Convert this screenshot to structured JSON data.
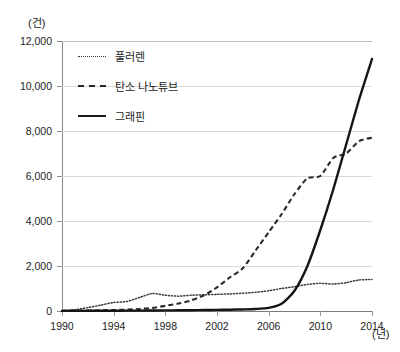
{
  "chart_data": {
    "type": "line",
    "title": "",
    "subtitle": "",
    "xlabel": "(년)",
    "ylabel": "(건)",
    "x": [
      1990,
      1991,
      1992,
      1993,
      1994,
      1995,
      1996,
      1997,
      1998,
      1999,
      2000,
      2001,
      2002,
      2003,
      2004,
      2005,
      2006,
      2007,
      2008,
      2009,
      2010,
      2011,
      2012,
      2013,
      2014
    ],
    "xlim": [
      1990,
      2014
    ],
    "ylim": [
      0,
      12000
    ],
    "ytick_values": [
      0,
      2000,
      4000,
      6000,
      8000,
      10000,
      12000
    ],
    "ytick_labels": [
      "0",
      "2,000",
      "4,000",
      "6,000",
      "8,000",
      "10,000",
      "12,000"
    ],
    "xtick_values": [
      1990,
      1994,
      1998,
      2002,
      2006,
      2010,
      2014
    ],
    "xtick_labels": [
      "1990",
      "1994",
      "1998",
      "2002",
      "2006",
      "2010",
      "2014"
    ],
    "grid": true,
    "legend_position": "upper-left",
    "series": [
      {
        "name": "풀러렌",
        "style": "dotted",
        "color": "#3a3a3a",
        "values": [
          20,
          60,
          150,
          260,
          380,
          420,
          600,
          780,
          700,
          660,
          700,
          720,
          740,
          760,
          790,
          830,
          900,
          1000,
          1080,
          1180,
          1230,
          1200,
          1260,
          1380,
          1400
        ]
      },
      {
        "name": "탄소 나노튜브",
        "style": "dashed",
        "color": "#2a2a2a",
        "values": [
          10,
          15,
          20,
          30,
          45,
          60,
          90,
          140,
          230,
          330,
          470,
          700,
          1050,
          1500,
          1900,
          2700,
          3500,
          4300,
          5200,
          5900,
          6000,
          6800,
          7000,
          7550,
          7700
        ]
      },
      {
        "name": "그래핀",
        "style": "solid",
        "color": "#151515",
        "values": [
          5,
          6,
          8,
          10,
          12,
          15,
          18,
          22,
          26,
          30,
          36,
          42,
          50,
          58,
          70,
          90,
          140,
          320,
          900,
          2000,
          3600,
          5400,
          7400,
          9400,
          11200
        ]
      }
    ]
  },
  "axes": {
    "y_unit": "(건)",
    "x_unit": "(년)"
  },
  "legend": {
    "items": [
      {
        "label": "풀러렌",
        "style": "dotted"
      },
      {
        "label": "탄소 나노튜브",
        "style": "dashed"
      },
      {
        "label": "그래핀",
        "style": "solid"
      }
    ]
  }
}
